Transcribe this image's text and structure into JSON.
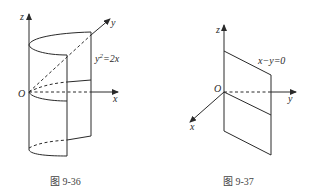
{
  "figures": [
    {
      "id": "fig-9-36",
      "caption": "图 9-36",
      "axes": {
        "z": "z",
        "y": "y",
        "x": "x",
        "origin": "O"
      },
      "equation_sup_base": "y",
      "equation_sup": "2",
      "equation_rest": "=2x",
      "surface": "parabolic cylinder y²=2x"
    },
    {
      "id": "fig-9-37",
      "caption": "图 9-37",
      "axes": {
        "z": "z",
        "y": "y",
        "x": "x",
        "origin": "O"
      },
      "equation": "x−y=0",
      "surface": "plane x−y=0"
    }
  ],
  "colors": {
    "stroke": "#2a2a2a",
    "caption": "#444444",
    "background": "#ffffff"
  }
}
